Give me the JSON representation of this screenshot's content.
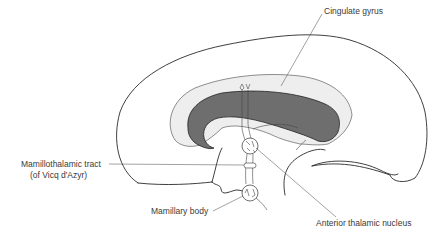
{
  "diagram": {
    "colors": {
      "background": "#ffffff",
      "outline": "#2a2a2a",
      "cingulate_fill": "#6e6e6e",
      "cingulate_light": "#e6e6e6",
      "label_text": "#3a3a3a"
    },
    "labels": {
      "cingulate_gyrus": "Cingulate gyrus",
      "mamillothalamic_tract_line1": "Mamillothalamic tract",
      "mamillothalamic_tract_line2": "(of Vicq d'Azyr)",
      "mamillary_body": "Mamillary body",
      "anterior_thalamic_nucleus": "Anterior thalamic nucleus"
    }
  }
}
